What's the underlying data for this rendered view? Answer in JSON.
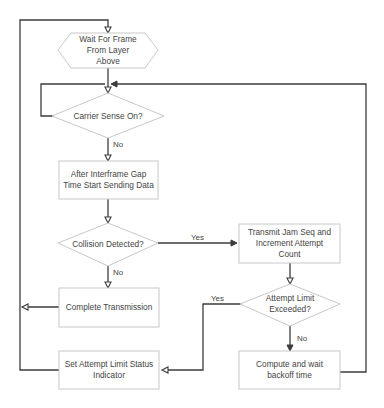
{
  "diagram": {
    "type": "flowchart",
    "title": "",
    "nodes": {
      "wait_frame": {
        "shape": "hexagon",
        "lines": [
          "Wait For Frame",
          "From Layer",
          "Above"
        ]
      },
      "carrier_sense": {
        "shape": "diamond",
        "lines": [
          "Carrier Sense On?"
        ]
      },
      "after_ifg": {
        "shape": "rectangle",
        "lines": [
          "After Interframe Gap",
          "Time Start Sending Data"
        ]
      },
      "collision": {
        "shape": "diamond",
        "lines": [
          "Collision Detected?"
        ]
      },
      "transmit_jam": {
        "shape": "rectangle",
        "lines": [
          "Transmit Jam Seq and",
          "Increment Attempt",
          "Count"
        ]
      },
      "attempt_limit": {
        "shape": "diamond",
        "lines": [
          "Attempt Limit",
          "Exceeded?"
        ]
      },
      "complete": {
        "shape": "rectangle",
        "lines": [
          "Complete Transmission"
        ]
      },
      "set_status": {
        "shape": "rectangle",
        "lines": [
          "Set Attempt Limit Status",
          "Indicator"
        ]
      },
      "backoff": {
        "shape": "rectangle",
        "lines": [
          "Compute and wait",
          "backoff time"
        ]
      }
    },
    "edge_labels": {
      "carrier_no": "No",
      "collision_yes": "Yes",
      "collision_no": "No",
      "limit_yes": "Yes",
      "limit_no": "No"
    },
    "edges": [
      {
        "from": "wait_frame",
        "to": "carrier_sense",
        "label": ""
      },
      {
        "from": "carrier_sense",
        "to": "carrier_sense",
        "label": "",
        "note": "loop back (Yes)"
      },
      {
        "from": "carrier_sense",
        "to": "after_ifg",
        "label": "No"
      },
      {
        "from": "after_ifg",
        "to": "collision",
        "label": ""
      },
      {
        "from": "collision",
        "to": "transmit_jam",
        "label": "Yes"
      },
      {
        "from": "collision",
        "to": "complete",
        "label": "No"
      },
      {
        "from": "transmit_jam",
        "to": "attempt_limit",
        "label": ""
      },
      {
        "from": "attempt_limit",
        "to": "set_status",
        "label": "Yes"
      },
      {
        "from": "attempt_limit",
        "to": "backoff",
        "label": "No"
      },
      {
        "from": "backoff",
        "to": "carrier_sense",
        "label": ""
      },
      {
        "from": "complete",
        "to": "wait_frame",
        "label": ""
      },
      {
        "from": "set_status",
        "to": "wait_frame",
        "label": ""
      }
    ]
  }
}
